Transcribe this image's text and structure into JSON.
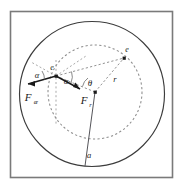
{
  "figure": {
    "background_color": "#ffffff",
    "frame": {
      "name": "outer-square-frame",
      "stroke_color": "#7a7a7a",
      "x": 10,
      "y": 11,
      "width": 163,
      "height": 167
    },
    "outer_circle": {
      "name": "outer-solid-circle",
      "stroke_color": "#3c3c3c",
      "style": "solid",
      "cx": 92,
      "cy": 94,
      "r": 73
    },
    "inner_circle": {
      "name": "inner-dashed-circle",
      "stroke_color": "#8c8c8c",
      "style": "dashed",
      "cx": 95,
      "cy": 92,
      "r": 47
    },
    "points": [
      {
        "name": "focus-point",
        "label": "F",
        "subscript": "r",
        "cx": 95,
        "cy": 92
      },
      {
        "name": "electron-point-left",
        "label": "e",
        "cx": 56,
        "cy": 76
      },
      {
        "name": "electron-point-right",
        "label": "e",
        "cx": 124,
        "cy": 58
      }
    ],
    "labels": {
      "force_ae": "F",
      "force_ae_sub": "æ",
      "force_r": "F",
      "force_r_sub": "r",
      "electron_left": "e",
      "electron_right": "e",
      "angle_alpha_left": "α",
      "angle_alpha_right": "α",
      "angle_theta": "θ",
      "radius_r": "r",
      "semi_major_a": "a"
    },
    "colors": {
      "frame_gray": "#7a7a7a",
      "solid_curve": "#3c3c3c",
      "dashed_curve": "#8c8c8c",
      "ink": "#1a1a1a",
      "paper": "#ffffff"
    }
  }
}
